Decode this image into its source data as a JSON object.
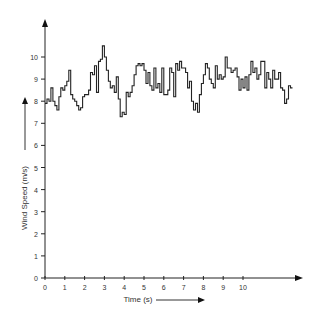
{
  "chart_data": {
    "type": "line",
    "title": "",
    "xlabel": "Time (s)",
    "ylabel": "Wind Speed (m/s)",
    "x_ticks": [
      "0",
      "1",
      "2",
      "3",
      "4",
      "5",
      "6",
      "7",
      "8",
      "9",
      "10"
    ],
    "y_ticks": [
      "0",
      "1",
      "2",
      "3",
      "4",
      "5",
      "6",
      "7",
      "8",
      "9",
      "10"
    ],
    "xlim": [
      0,
      13
    ],
    "ylim": [
      0,
      11
    ],
    "grid": false,
    "legend": null,
    "style": "step",
    "series": [
      {
        "name": "Wind Speed",
        "x": [
          0,
          0.1,
          0.2,
          0.3,
          0.4,
          0.5,
          0.6,
          0.7,
          0.8,
          0.9,
          1.0,
          1.1,
          1.2,
          1.3,
          1.4,
          1.5,
          1.6,
          1.7,
          1.8,
          1.9,
          2.0,
          2.1,
          2.2,
          2.3,
          2.4,
          2.5,
          2.6,
          2.7,
          2.8,
          2.9,
          3.0,
          3.1,
          3.2,
          3.3,
          3.4,
          3.5,
          3.6,
          3.7,
          3.8,
          3.9,
          4.0,
          4.1,
          4.2,
          4.3,
          4.4,
          4.5,
          4.6,
          4.7,
          4.8,
          4.9,
          5.0,
          5.1,
          5.2,
          5.3,
          5.4,
          5.5,
          5.6,
          5.7,
          5.8,
          5.9,
          6.0,
          6.1,
          6.2,
          6.3,
          6.4,
          6.5,
          6.6,
          6.7,
          6.8,
          6.9,
          7.0,
          7.1,
          7.2,
          7.3,
          7.4,
          7.5,
          7.6,
          7.7,
          7.8,
          7.9,
          8.0,
          8.1,
          8.2,
          8.3,
          8.4,
          8.5,
          8.6,
          8.7,
          8.8,
          8.9,
          9.0,
          9.1,
          9.2,
          9.3,
          9.4,
          9.5,
          9.6,
          9.7,
          9.8,
          9.9,
          10.0,
          10.1,
          10.2,
          10.3,
          10.4,
          10.5,
          10.6,
          10.7,
          10.8,
          10.9,
          11.0,
          11.1,
          11.2,
          11.3,
          11.4,
          11.5,
          11.6,
          11.7,
          11.8,
          11.9,
          12.0,
          12.1,
          12.2,
          12.3,
          12.4
        ],
        "y": [
          7.9,
          8.1,
          8.0,
          8.6,
          8.0,
          7.8,
          7.6,
          8.2,
          8.6,
          8.5,
          8.7,
          8.9,
          9.4,
          8.3,
          8.1,
          8.0,
          7.8,
          7.6,
          7.7,
          8.2,
          8.3,
          8.3,
          8.5,
          9.3,
          9.2,
          9.6,
          8.4,
          9.8,
          9.9,
          10.5,
          10.0,
          9.4,
          8.9,
          8.6,
          8.7,
          8.4,
          9.1,
          8.1,
          7.3,
          7.5,
          7.4,
          8.4,
          8.2,
          8.4,
          8.7,
          9.2,
          9.6,
          9.7,
          9.6,
          9.7,
          9.4,
          8.8,
          9.3,
          8.7,
          8.5,
          9.5,
          8.6,
          8.8,
          8.4,
          9.5,
          8.3,
          8.3,
          8.5,
          9.5,
          9.3,
          8.2,
          9.7,
          9.4,
          9.8,
          9.5,
          9.5,
          9.3,
          8.6,
          8.9,
          8.0,
          7.6,
          7.9,
          7.5,
          8.3,
          8.8,
          9.2,
          9.7,
          9.5,
          9.0,
          8.8,
          8.6,
          9.6,
          9.0,
          9.2,
          9.0,
          9.1,
          10.0,
          9.5,
          9.5,
          9.3,
          9.4,
          9.5,
          9.1,
          8.5,
          9.0,
          8.6,
          9.1,
          8.5,
          9.2,
          9.8,
          9.3,
          9.5,
          9.0,
          9.2,
          9.8,
          9.8,
          8.6,
          9.3,
          9.0,
          8.6,
          9.4,
          9.0,
          9.0,
          9.3,
          8.6,
          8.5,
          7.9,
          8.1,
          8.7,
          8.6
        ]
      }
    ]
  }
}
